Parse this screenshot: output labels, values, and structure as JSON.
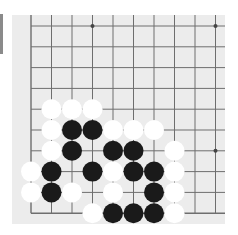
{
  "board": {
    "view": "bottom-left corner",
    "columns_visible": 10,
    "rows_visible": 10,
    "colors": {
      "background": "#ececec",
      "grid": "#6e6e6e",
      "black_stone": "#1a1a1a",
      "white_stone": "#ffffff",
      "side_bar": "#8a8a8a"
    },
    "star_points": [
      {
        "col": 3,
        "row": 0
      },
      {
        "col": 9,
        "row": 0
      },
      {
        "col": 9,
        "row": 6
      }
    ],
    "stones": [
      {
        "color": "white",
        "col": 1,
        "row": 4
      },
      {
        "color": "white",
        "col": 2,
        "row": 4
      },
      {
        "color": "white",
        "col": 3,
        "row": 4
      },
      {
        "color": "white",
        "col": 1,
        "row": 5
      },
      {
        "color": "black",
        "col": 2,
        "row": 5
      },
      {
        "color": "black",
        "col": 3,
        "row": 5
      },
      {
        "color": "white",
        "col": 4,
        "row": 5
      },
      {
        "color": "white",
        "col": 5,
        "row": 5
      },
      {
        "color": "white",
        "col": 6,
        "row": 5
      },
      {
        "color": "white",
        "col": 1,
        "row": 6
      },
      {
        "color": "black",
        "col": 2,
        "row": 6
      },
      {
        "color": "black",
        "col": 4,
        "row": 6
      },
      {
        "color": "black",
        "col": 5,
        "row": 6
      },
      {
        "color": "white",
        "col": 7,
        "row": 6
      },
      {
        "color": "white",
        "col": 0,
        "row": 7
      },
      {
        "color": "black",
        "col": 1,
        "row": 7
      },
      {
        "color": "black",
        "col": 3,
        "row": 7
      },
      {
        "color": "white",
        "col": 4,
        "row": 7
      },
      {
        "color": "black",
        "col": 5,
        "row": 7
      },
      {
        "color": "black",
        "col": 6,
        "row": 7
      },
      {
        "color": "white",
        "col": 7,
        "row": 7
      },
      {
        "color": "white",
        "col": 0,
        "row": 8
      },
      {
        "color": "black",
        "col": 1,
        "row": 8
      },
      {
        "color": "white",
        "col": 2,
        "row": 8
      },
      {
        "color": "white",
        "col": 4,
        "row": 8
      },
      {
        "color": "black",
        "col": 6,
        "row": 8
      },
      {
        "color": "white",
        "col": 7,
        "row": 8
      },
      {
        "color": "white",
        "col": 3,
        "row": 9
      },
      {
        "color": "black",
        "col": 4,
        "row": 9
      },
      {
        "color": "black",
        "col": 5,
        "row": 9
      },
      {
        "color": "black",
        "col": 6,
        "row": 9
      },
      {
        "color": "white",
        "col": 7,
        "row": 9
      }
    ]
  }
}
